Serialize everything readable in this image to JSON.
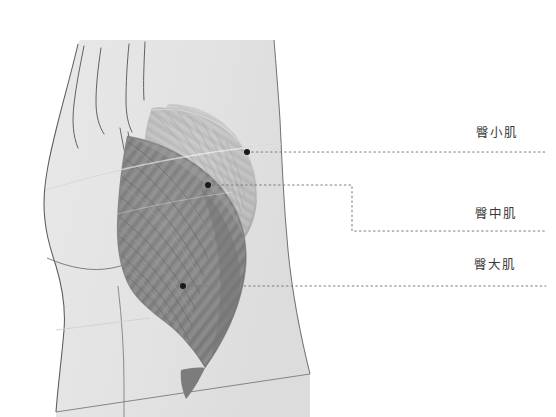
{
  "figure": {
    "background_color": "#ffffff",
    "view": "lateral posterior hip"
  },
  "colors": {
    "background": "#ffffff",
    "body_silhouette": "#e3e3e3",
    "body_outline": "#4a4a4a",
    "gluteus_minimus": "#cfcfcf",
    "gluteus_medius": "#bdbdbd",
    "gluteus_maximus": "#8a8a8a",
    "gluteus_maximus_shadow": "#6f6f6f",
    "leader_line": "#777777",
    "marker_dot": "#1a1a1a",
    "label_text": "#3a3a3a"
  },
  "labels": [
    {
      "id": "gluteus-minimus",
      "text": "臀小肌",
      "marker": {
        "x": 247,
        "y": 152
      },
      "leader_type": "straight",
      "leader_end_x": 546,
      "leader_y": 152
    },
    {
      "id": "gluteus-medius",
      "text": "臀中肌",
      "marker": {
        "x": 208,
        "y": 185
      },
      "leader_type": "stepped",
      "leader_corner_x": 352,
      "leader_y_start": 185,
      "leader_y_end": 231,
      "leader_end_x": 546
    },
    {
      "id": "gluteus-maximus",
      "text": "臀大肌",
      "marker": {
        "x": 183,
        "y": 286
      },
      "leader_type": "straight",
      "leader_end_x": 546,
      "leader_y": 286
    }
  ],
  "anatomy": {
    "parts": [
      {
        "name": "torso",
        "description": "lower back with spine contour lines"
      },
      {
        "name": "buttock",
        "description": "gluteal prominence silhouette"
      },
      {
        "name": "thigh",
        "description": "upper leg extending to bottom edge"
      },
      {
        "name": "gluteus-minimus",
        "description": "deepest small fan muscle, light gray"
      },
      {
        "name": "gluteus-medius",
        "description": "mid fan-shaped muscle with fine striations"
      },
      {
        "name": "gluteus-maximus",
        "description": "large superficial muscle with radiating fibers"
      }
    ]
  }
}
